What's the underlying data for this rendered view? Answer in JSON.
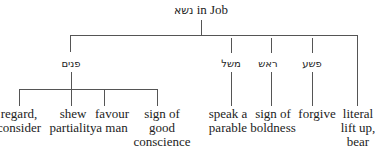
{
  "title": {
    "hebrew": "נשא",
    "text": " in Job"
  },
  "branches": [
    {
      "label": "פנים",
      "children": [
        {
          "lines": [
            "regard,",
            "consider"
          ]
        },
        {
          "lines": [
            "shew",
            "partiality"
          ]
        },
        {
          "lines": [
            "favour",
            "a man"
          ]
        },
        {
          "lines": [
            "sign of",
            "good",
            "conscience"
          ]
        }
      ]
    },
    {
      "label": "משל",
      "children": [
        {
          "lines": [
            "speak a",
            "parable"
          ]
        }
      ]
    },
    {
      "label": "ראש",
      "children": [
        {
          "lines": [
            "sign of",
            "boldness"
          ]
        }
      ]
    },
    {
      "label": "פשע",
      "children": [
        {
          "lines": [
            "forgive"
          ]
        }
      ]
    },
    {
      "label": "",
      "children": [
        {
          "lines": [
            "literal",
            "lift up,",
            "bear"
          ]
        }
      ]
    }
  ]
}
